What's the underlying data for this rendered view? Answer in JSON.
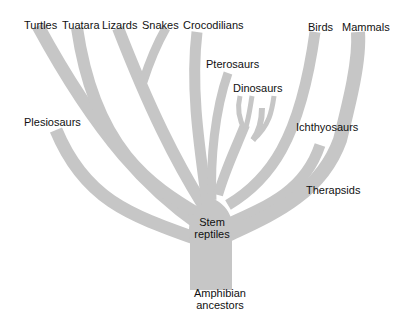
{
  "diagram": {
    "type": "phylogenetic-tree",
    "branch_color": "#c6c6c6",
    "text_color": "#111111",
    "root": {
      "label": "Amphibian ancestors",
      "lines": [
        "Amphibian",
        "ancestors"
      ]
    },
    "trunk": {
      "label": "Stem reptiles",
      "lines": [
        "Stem",
        "reptiles"
      ]
    },
    "top_labels": {
      "turtles": "Turtles",
      "tuatara": "Tuatara",
      "lizards": "Lizards",
      "snakes": "Snakes",
      "crocodilians": "Crocodilians",
      "birds": "Birds",
      "mammals": "Mammals"
    },
    "side_labels": {
      "plesiosaurs": "Plesiosaurs",
      "pterosaurs": "Pterosaurs",
      "dinosaurs": "Dinosaurs",
      "ichthyosaurs": "Ichthyosaurs",
      "therapsids": "Therapsids"
    },
    "edges": [
      [
        "Amphibian ancestors",
        "Stem reptiles"
      ],
      [
        "Stem reptiles",
        "Turtles"
      ],
      [
        "Stem reptiles",
        "Tuatara"
      ],
      [
        "Stem reptiles",
        "Lizards"
      ],
      [
        "Lizards",
        "Snakes"
      ],
      [
        "Stem reptiles",
        "Plesiosaurs"
      ],
      [
        "Stem reptiles",
        "Crocodilians"
      ],
      [
        "Stem reptiles",
        "Pterosaurs"
      ],
      [
        "Stem reptiles",
        "Dinosaurs"
      ],
      [
        "Stem reptiles",
        "Birds"
      ],
      [
        "Stem reptiles",
        "Ichthyosaurs"
      ],
      [
        "Stem reptiles",
        "Therapsids"
      ],
      [
        "Therapsids",
        "Mammals"
      ]
    ]
  }
}
